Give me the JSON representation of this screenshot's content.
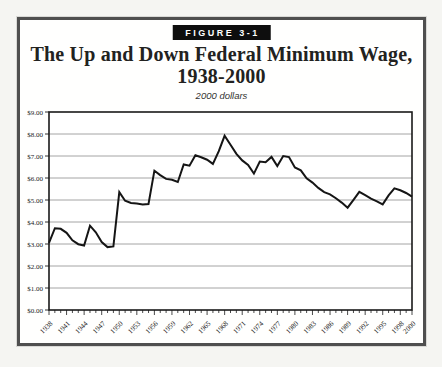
{
  "figure": {
    "label": "FIGURE 3-1",
    "title_line1": "The Up and Down Federal Minimum Wage,",
    "title_line2": "1938-2000",
    "subtitle": "2000 dollars"
  },
  "colors": {
    "frame_border": "#4f4f4f",
    "badge_bg": "#0e0e0e",
    "badge_text": "#ffffff",
    "line": "#151515",
    "grid": "#9a9a9a",
    "axis": "#1a1a1a",
    "text": "#222220"
  },
  "chart_data": {
    "type": "line",
    "title": "The Up and Down Federal Minimum Wage, 1938-2000",
    "subtitle": "2000 dollars",
    "xlabel": "",
    "ylabel": "",
    "ylim": [
      0,
      9
    ],
    "ytick_step": 1,
    "grid": "horizontal",
    "legend": "none",
    "y_tick_labels": [
      "$0.00",
      "$1.00",
      "$2.00",
      "$3.00",
      "$4.00",
      "$5.00",
      "$6.00",
      "$7.00",
      "$8.00",
      "$9.00"
    ],
    "x_label_years": [
      1938,
      1941,
      1944,
      1947,
      1950,
      1953,
      1956,
      1959,
      1962,
      1965,
      1968,
      1971,
      1974,
      1977,
      1980,
      1983,
      1986,
      1989,
      1992,
      1995,
      1998,
      2000
    ],
    "x": [
      1938,
      1939,
      1940,
      1941,
      1942,
      1943,
      1944,
      1945,
      1946,
      1947,
      1948,
      1949,
      1950,
      1951,
      1952,
      1953,
      1954,
      1955,
      1956,
      1957,
      1958,
      1959,
      1960,
      1961,
      1962,
      1963,
      1964,
      1965,
      1966,
      1967,
      1968,
      1969,
      1970,
      1971,
      1972,
      1973,
      1974,
      1975,
      1976,
      1977,
      1978,
      1979,
      1980,
      1981,
      1982,
      1983,
      1984,
      1985,
      1986,
      1987,
      1988,
      1989,
      1990,
      1991,
      1992,
      1993,
      1994,
      1995,
      1996,
      1997,
      1998,
      1999,
      2000
    ],
    "values": [
      3.05,
      3.72,
      3.69,
      3.51,
      3.17,
      2.99,
      2.93,
      3.83,
      3.53,
      3.09,
      2.86,
      2.89,
      5.36,
      4.97,
      4.87,
      4.84,
      4.8,
      4.82,
      6.33,
      6.13,
      5.96,
      5.92,
      5.82,
      6.62,
      6.56,
      7.03,
      6.94,
      6.83,
      6.64,
      7.22,
      7.92,
      7.51,
      7.1,
      6.8,
      6.59,
      6.2,
      6.75,
      6.72,
      6.96,
      6.54,
      7.0,
      6.95,
      6.48,
      6.35,
      5.98,
      5.79,
      5.55,
      5.36,
      5.26,
      5.08,
      4.88,
      4.65,
      5.01,
      5.37,
      5.22,
      5.06,
      4.94,
      4.8,
      5.21,
      5.53,
      5.44,
      5.32,
      5.15
    ]
  }
}
